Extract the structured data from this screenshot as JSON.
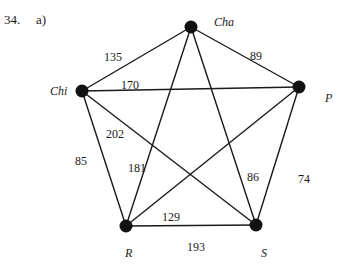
{
  "problem": {
    "number": "34.",
    "part": "a)"
  },
  "nodes": [
    {
      "id": "Cha",
      "label": "Cha",
      "x": 191,
      "y": 27,
      "lx": 214,
      "ly": 16
    },
    {
      "id": "Chi",
      "label": "Chi",
      "x": 82,
      "y": 91,
      "lx": 50,
      "ly": 85
    },
    {
      "id": "P",
      "label": "P",
      "x": 299,
      "y": 87,
      "lx": 325,
      "ly": 92
    },
    {
      "id": "R",
      "label": "R",
      "x": 126,
      "y": 226,
      "lx": 125,
      "ly": 247
    },
    {
      "id": "S",
      "label": "S",
      "x": 256,
      "y": 225,
      "lx": 261,
      "ly": 247
    }
  ],
  "edges": [
    {
      "from": "Chi",
      "to": "Cha",
      "weight": "135",
      "lx": 104,
      "ly": 51
    },
    {
      "from": "Cha",
      "to": "P",
      "weight": "89",
      "lx": 250,
      "ly": 50
    },
    {
      "from": "Chi",
      "to": "P",
      "weight": "170",
      "lx": 121,
      "ly": 79
    },
    {
      "from": "Chi",
      "to": "S",
      "weight": "202",
      "lx": 106,
      "ly": 128
    },
    {
      "from": "Chi",
      "to": "R",
      "weight": "85",
      "lx": 75,
      "ly": 155
    },
    {
      "from": "Cha",
      "to": "R",
      "weight": "181",
      "lx": 128,
      "ly": 162
    },
    {
      "from": "Cha",
      "to": "S",
      "weight": "86",
      "lx": 247,
      "ly": 171
    },
    {
      "from": "P",
      "to": "S",
      "weight": "74",
      "lx": 298,
      "ly": 173
    },
    {
      "from": "P",
      "to": "R",
      "weight": "129",
      "lx": 162,
      "ly": 211
    },
    {
      "from": "R",
      "to": "S",
      "weight": "193",
      "lx": 187,
      "ly": 241
    }
  ]
}
